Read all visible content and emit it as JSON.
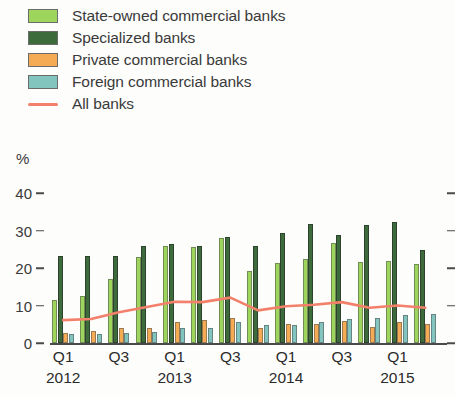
{
  "legend": {
    "items": [
      {
        "label": "State-owned commercial banks",
        "color": "#9ed55d",
        "marker": "swatch"
      },
      {
        "label": "Specialized banks",
        "color": "#3e6b3c",
        "marker": "swatch"
      },
      {
        "label": "Private commercial banks",
        "color": "#f5ab54",
        "marker": "swatch"
      },
      {
        "label": "Foreign commercial banks",
        "color": "#81c5be",
        "marker": "swatch"
      },
      {
        "label": "All banks",
        "color": "#f2806a",
        "marker": "line"
      }
    ]
  },
  "axis": {
    "unit_label": "%",
    "y_ticks": [
      "0",
      "10",
      "20",
      "30",
      "40"
    ],
    "x_tick_quarters": [
      "Q1",
      "Q3",
      "Q1",
      "Q3",
      "Q1",
      "Q3",
      "Q1"
    ],
    "x_tick_years": [
      "2012",
      "",
      "2013",
      "",
      "2014",
      "",
      "2015"
    ]
  },
  "chart_data": {
    "type": "bar",
    "title": "",
    "subtitle": "",
    "xlabel": "",
    "ylabel": "%",
    "ylim": [
      0,
      40
    ],
    "yticks": [
      0,
      10,
      20,
      30,
      40
    ],
    "grid": false,
    "legend_position": "top-left",
    "categories": [
      "Q1 2012",
      "Q2 2012",
      "Q3 2012",
      "Q4 2012",
      "Q1 2013",
      "Q2 2013",
      "Q3 2013",
      "Q4 2013",
      "Q1 2014",
      "Q2 2014",
      "Q3 2014",
      "Q4 2014",
      "Q1 2015",
      "Q2 2015"
    ],
    "series": [
      {
        "name": "State-owned commercial banks",
        "color": "#9ed55d",
        "type": "bar",
        "values": [
          11.4,
          12.6,
          17.0,
          23.0,
          26.0,
          25.5,
          28.0,
          19.3,
          21.3,
          22.5,
          26.6,
          21.5,
          22.0,
          21.2
        ]
      },
      {
        "name": "Specialized banks",
        "color": "#3e6b3c",
        "type": "bar",
        "values": [
          23.2,
          23.1,
          23.3,
          26.0,
          26.3,
          25.8,
          28.3,
          26.0,
          29.3,
          31.8,
          28.7,
          31.5,
          32.2,
          24.7
        ]
      },
      {
        "name": "Private commercial banks",
        "color": "#f5ab54",
        "type": "bar",
        "values": [
          2.7,
          3.2,
          4.1,
          4.0,
          5.6,
          6.1,
          6.7,
          3.9,
          5.1,
          5.2,
          5.9,
          4.3,
          5.5,
          5.1
        ]
      },
      {
        "name": "Foreign commercial banks",
        "color": "#81c5be",
        "type": "bar",
        "values": [
          2.5,
          2.5,
          2.7,
          2.9,
          4.1,
          4.1,
          5.5,
          4.9,
          4.7,
          5.5,
          6.4,
          6.7,
          7.6,
          7.7
        ]
      },
      {
        "name": "All banks",
        "color": "#f2806a",
        "type": "line",
        "values": [
          6.1,
          6.4,
          8.2,
          9.6,
          11.0,
          10.9,
          12.1,
          8.7,
          9.8,
          10.2,
          10.9,
          9.4,
          10.0,
          9.4
        ]
      }
    ]
  }
}
